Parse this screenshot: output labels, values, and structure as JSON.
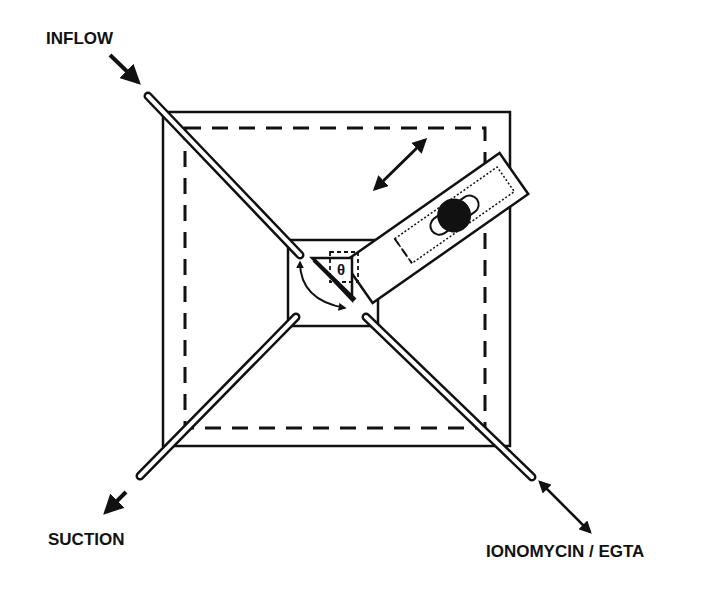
{
  "labels": {
    "inflow": "INFLOW",
    "suction": "SUCTION",
    "ionomycin": "IONOMYCIN / EGTA",
    "theta": "θ"
  },
  "colors": {
    "ink": "#111111",
    "background": "#ffffff"
  },
  "components": {
    "outer_chamber": "outer-square",
    "inner_bath": "dashed-square",
    "center_well": "center-square",
    "tubes": [
      "inflow-tube",
      "suction-tube",
      "ionomycin-tube",
      "center-top-right-tube"
    ],
    "slider": "rotating-slider-with-electrode"
  }
}
